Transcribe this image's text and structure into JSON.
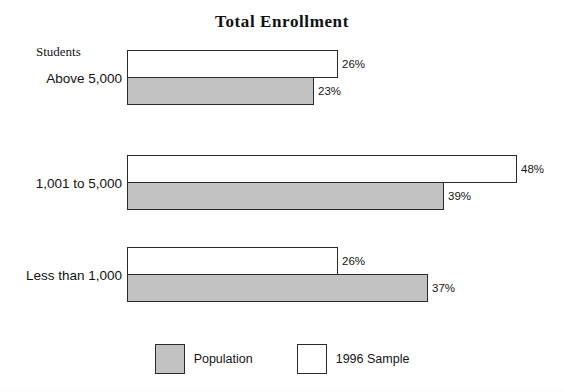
{
  "chart_data": {
    "type": "bar",
    "orientation": "horizontal",
    "title": "Total Enrollment",
    "xlabel": "",
    "ylabel": "Students",
    "axis_caption": "Students",
    "categories": [
      "Above 5,000",
      "1,001 to 5,000",
      "Less than 1,000"
    ],
    "series": [
      {
        "name": "1996 Sample",
        "color": "#ffffff",
        "values": [
          26,
          48,
          26
        ],
        "value_labels": [
          "26%",
          "48%",
          "26%"
        ]
      },
      {
        "name": "Population",
        "color": "#c2c2c2",
        "values": [
          23,
          39,
          37
        ],
        "value_labels": [
          "23%",
          "39%",
          "37%"
        ]
      }
    ],
    "xlim": [
      0,
      48
    ],
    "units": "percent",
    "grid": false,
    "legend_position": "bottom"
  },
  "title": {
    "text": "Total Enrollment"
  },
  "axis": {
    "caption": "Students"
  },
  "groups": [
    {
      "label": "Above 5,000",
      "sample_label": "26%",
      "population_label": "23%",
      "sample_width": "211px",
      "population_width": "187px"
    },
    {
      "label": "1,001 to 5,000",
      "sample_label": "48%",
      "population_label": "39%",
      "sample_width": "390px",
      "population_width": "317px"
    },
    {
      "label": "Less than 1,000",
      "sample_label": "26%",
      "population_label": "37%",
      "sample_width": "211px",
      "population_width": "301px"
    }
  ],
  "legend": {
    "items": [
      {
        "name": "Population",
        "swatch": "gray"
      },
      {
        "name": "1996 Sample",
        "swatch": "white"
      }
    ]
  },
  "colors": {
    "population_fill": "#c2c2c2",
    "sample_fill": "#ffffff",
    "bar_border": "#2b2b2b",
    "text": "#141414",
    "background": "#ffffff"
  }
}
